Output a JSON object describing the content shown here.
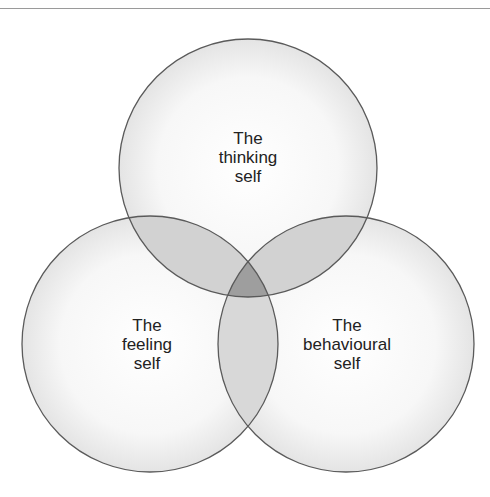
{
  "diagram": {
    "type": "venn",
    "circles": [
      {
        "id": "thinking",
        "label_lines": [
          "The",
          "thinking",
          "self"
        ],
        "cx": 248,
        "cy": 168,
        "r": 129
      },
      {
        "id": "feeling",
        "label_lines": [
          "The",
          "feeling",
          "self"
        ],
        "cx": 150,
        "cy": 344,
        "r": 128
      },
      {
        "id": "behavioural",
        "label_lines": [
          "The",
          "behavioural",
          "self"
        ],
        "cx": 346,
        "cy": 344,
        "r": 128
      }
    ],
    "colors": {
      "stroke": "#5a5a5a",
      "fill_single": "#f2f2f2",
      "fill_double": "#c8c8c8",
      "fill_triple": "#9a9a9a",
      "rule": "#9a9a9a"
    }
  }
}
